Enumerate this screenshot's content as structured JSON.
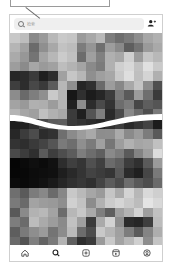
{
  "callout": {
    "label": ""
  },
  "header": {
    "search": {
      "placeholder": "检索",
      "icon": "search-icon"
    },
    "add_user_icon": "add-user-icon"
  },
  "explore_grid": {
    "description": "pixelated grayscale thumbnail mosaic, split by wavy break",
    "top_rows": [
      [
        "#c8c8c8",
        "#bdbdbd",
        "#8a8a8a",
        "#9a9a9a",
        "#b8b8b8",
        "#c9c9c9",
        "#c5c5c5",
        "#9b9b9b",
        "#a8a8a8",
        "#b9b9b9",
        "#7e7e7e",
        "#6e6e6e",
        "#7a7a7a",
        "#8e8e8e",
        "#a6a6a6",
        "#b0b0b0"
      ],
      [
        "#b5b5b5",
        "#a1a1a1",
        "#6b6b6b",
        "#8f8f8f",
        "#a8a8a8",
        "#c2c2c2",
        "#bcbcbc",
        "#7c7c7c",
        "#959595",
        "#6f6f6f",
        "#9d9d9d",
        "#8a8a8a",
        "#5e5e5e",
        "#737373",
        "#9a9a9a",
        "#a9a9a9"
      ],
      [
        "#aaaaaa",
        "#979797",
        "#747474",
        "#a4a4a4",
        "#b7b7b7",
        "#cbcbcb",
        "#c0c0c0",
        "#6c6c6c",
        "#9f9f9f",
        "#808080",
        "#b0b0b0",
        "#a7a7a7",
        "#cfcfcf",
        "#9c9c9c",
        "#c5c5c5",
        "#b8b8b8"
      ],
      [
        "#9d9d9d",
        "#8b8b8b",
        "#a6a6a6",
        "#9a9a9a",
        "#a1a1a1",
        "#bdbdbd",
        "#b3b3b3",
        "#a4a4a4",
        "#8a8a8a",
        "#7b7b7b",
        "#b1b1b1",
        "#cfcfcf",
        "#d8d8d8",
        "#c2c2c2",
        "#e0e0e0",
        "#cacaca"
      ],
      [
        "#262626",
        "#2c2c2c",
        "#3b3b3b",
        "#1f1f1f",
        "#2e2e2e",
        "#a1a1a1",
        "#c6c6c6",
        "#b6b6b6",
        "#8f8f8f",
        "#9f9f9f",
        "#a7a7a7",
        "#c9c9c9",
        "#dedede",
        "#bfbfbf",
        "#d4d4d4",
        "#b0b0b0"
      ],
      [
        "#3e3e3e",
        "#2d2d2d",
        "#484848",
        "#3a3a3a",
        "#5c5c5c",
        "#b7b7b7",
        "#8e8e8e",
        "#252525",
        "#2f2f2f",
        "#6a6a6a",
        "#9c9c9c",
        "#878787",
        "#a8a8a8",
        "#c4c4c4",
        "#8c8c8c",
        "#4f4f4f"
      ],
      [
        "#8c8c8c",
        "#6a6a6a",
        "#7e7e7e",
        "#8f8f8f",
        "#c9c9c9",
        "#b4b4b4",
        "#171717",
        "#303030",
        "#1c1c1c",
        "#262626",
        "#3c3c3c",
        "#797979",
        "#5a5a5a",
        "#9b9b9b",
        "#6e6e6e",
        "#3a3a3a"
      ],
      [
        "#a3a3a3",
        "#999999",
        "#b0b0b0",
        "#aeaeae",
        "#9c9c9c",
        "#b5b5b5",
        "#222222",
        "#8d8d8d",
        "#2c2c2c",
        "#4a4a4a",
        "#333333",
        "#6d6d6d",
        "#7c7c7c",
        "#474747",
        "#5e5e5e",
        "#555555"
      ],
      [
        "#b4b4b4",
        "#a6a6a6",
        "#9f9f9f",
        "#c0c0c0",
        "#b1b1b1",
        "#a8a8a8",
        "#3b3b3b",
        "#1f1f1f",
        "#545454",
        "#7f7f7f",
        "#2a2a2a",
        "#4b4b4b",
        "#898989",
        "#6b6b6b",
        "#4e4e4e",
        "#7a7a7a"
      ]
    ],
    "bottom_rows": [
      [
        "#1e1e1e",
        "#222222",
        "#2f2f2f",
        "#494949",
        "#5b5b5b",
        "#5e5e5e",
        "#3a3a3a",
        "#333333",
        "#2c2c2c",
        "#262626",
        "#303030",
        "#3d3d3d",
        "#2a2a2a",
        "#353535",
        "#434343",
        "#1c1c1c"
      ],
      [
        "#272727",
        "#3c3c3c",
        "#4c4c4c",
        "#2c2c2c",
        "#323232",
        "#6f6f6f",
        "#8b8b8b",
        "#9c9c9c",
        "#a9a9a9",
        "#8d8d8d",
        "#8e8e8e",
        "#aaaaaa",
        "#8a8a8a",
        "#9b9b9b",
        "#7c7c7c",
        "#595959"
      ],
      [
        "#333333",
        "#2e2e2e",
        "#3a3a3a",
        "#444444",
        "#555555",
        "#7a7a7a",
        "#6e6e6e",
        "#8f8f8f",
        "#7b7b7b",
        "#a0a0a0",
        "#767676",
        "#9d9d9d",
        "#b1b1b1",
        "#a5a5a5",
        "#a9a9a9",
        "#c0c0c0"
      ],
      [
        "#4a4a4a",
        "#3c3c3c",
        "#2f2f2f",
        "#5b5b5b",
        "#3e3e3e",
        "#4e4e4e",
        "#5c5c5c",
        "#7e7e7e",
        "#6d6d6d",
        "#5f5f5f",
        "#8a8a8a",
        "#7c7c7c",
        "#5a5a5a",
        "#838383",
        "#9e9e9e",
        "#dcdcdc"
      ],
      [
        "#050505",
        "#0a0a0a",
        "#0f0f0f",
        "#0b0b0b",
        "#111111",
        "#2d2d2d",
        "#3f3f3f",
        "#353535",
        "#505050",
        "#404040",
        "#6b6b6b",
        "#5e5e5e",
        "#3d3d3d",
        "#303030",
        "#5a5a5a",
        "#9a9a9a"
      ],
      [
        "#060606",
        "#080808",
        "#0c0c0c",
        "#0e0e0e",
        "#101010",
        "#1e1e1e",
        "#292929",
        "#343434",
        "#434343",
        "#3c3c3c",
        "#353535",
        "#585858",
        "#2b2b2b",
        "#1f1f1f",
        "#464646",
        "#797979"
      ],
      [
        "#0b0b0b",
        "#090909",
        "#0d0d0d",
        "#121212",
        "#1a1a1a",
        "#262626",
        "#303030",
        "#373737",
        "#2f2f2f",
        "#444444",
        "#5c5c5c",
        "#4b4b4b",
        "#6d6d6d",
        "#595959",
        "#4d4d4d",
        "#6a6a6a"
      ],
      [
        "#6f6f6f",
        "#5a5a5a",
        "#7c7c7c",
        "#888888",
        "#6b6b6b",
        "#878787",
        "#c8c8c8",
        "#b9b9b9",
        "#a6a6a6",
        "#9a9a9a",
        "#c5c5c5",
        "#aaaaaa",
        "#d3d3d3",
        "#b7b7b7",
        "#d9d9d9",
        "#cfcfcf"
      ],
      [
        "#7a7a7a",
        "#6a6a6a",
        "#a3a3a3",
        "#9c9c9c",
        "#999999",
        "#8e8e8e",
        "#d0d0d0",
        "#c2c2c2",
        "#8c8c8c",
        "#b1b1b1",
        "#cbcbcb",
        "#d5d5d5",
        "#c9c9c9",
        "#bcbcbc",
        "#e4e4e4",
        "#d8d8d8"
      ],
      [
        "#595959",
        "#8a8a8a",
        "#b2b2b2",
        "#b8b8b8",
        "#a3a3a3",
        "#6c6c6c",
        "#b7b7b7",
        "#c7c7c7",
        "#a9a9a9",
        "#7e7e7e",
        "#5e5e5e",
        "#9f9f9f",
        "#b3b3b3",
        "#d3d3d3",
        "#9e9e9e",
        "#c1c1c1"
      ],
      [
        "#7d7d7d",
        "#6b6b6b",
        "#bcbcbc",
        "#aaaaaa",
        "#9c9c9c",
        "#8a8a8a",
        "#c1c1c1",
        "#9f9f9f",
        "#3a3a3a",
        "#aaaaaa",
        "#d2d2d2",
        "#8e8e8e",
        "#2c2c2c",
        "#262626",
        "#3e3e3e",
        "#bcbcbc"
      ],
      [
        "#5e5e5e",
        "#7a7a7a",
        "#8e8e8e",
        "#9b9b9b",
        "#747474",
        "#8c8c8c",
        "#bababa",
        "#6c6c6c",
        "#4c4c4c",
        "#c8c8c8",
        "#b5b5b5",
        "#a0a0a0",
        "#7d7d7d",
        "#5b5b5b",
        "#848484",
        "#aeaeae"
      ],
      [
        "#6a6a6a",
        "#535353",
        "#7f7f7f",
        "#636363",
        "#7a7a7a",
        "#b3b3b3",
        "#5f5f5f",
        "#2e2e2e",
        "#3a3a3a",
        "#9a9a9a",
        "#c9c9c9",
        "#a3a3a3",
        "#b8b8b8",
        "#d0d0d0",
        "#8d8d8d",
        "#c4c4c4"
      ]
    ]
  },
  "bottom_nav": {
    "items": [
      {
        "name": "home",
        "icon": "home-icon"
      },
      {
        "name": "search",
        "icon": "search-icon"
      },
      {
        "name": "create",
        "icon": "plus-square-icon"
      },
      {
        "name": "reels",
        "icon": "reels-icon"
      },
      {
        "name": "profile",
        "icon": "profile-icon"
      }
    ]
  },
  "colors": {
    "frame_border": "#cfcfcf",
    "search_bg": "#efefef",
    "icon": "#333333",
    "callout_border": "#9a9a9a"
  }
}
